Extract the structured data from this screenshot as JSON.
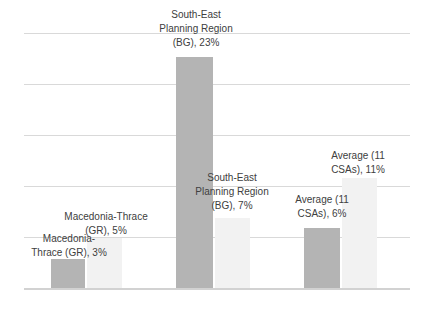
{
  "chart_data": {
    "type": "bar",
    "title": "",
    "xlabel": "",
    "ylabel": "",
    "value_unit": "%",
    "ylim": [
      0,
      25
    ],
    "gridline_interval_percent": 5,
    "grid": true,
    "legend": false,
    "px_per_percent": 10.1,
    "categories": [
      "Macedonia-Thrace (GR)",
      "South-East Planning Region (BG)",
      "Average (11 CSAs)"
    ],
    "series": [
      {
        "name": "dark-gray-series",
        "color": "#b4b4b4",
        "values": [
          3,
          23,
          6
        ]
      },
      {
        "name": "light-gray-series",
        "color": "#f2f2f2",
        "values": [
          5,
          7,
          11
        ]
      }
    ],
    "colors": {
      "gridline": "#d9d9d9",
      "axis_line": "#d2d2d2",
      "label_text": "#404040",
      "background": "#ffffff"
    }
  },
  "labels": {
    "mt_dark": {
      "line1": "Macedonia-",
      "line2": "Thrace (GR), 3%"
    },
    "mt_light": {
      "line1": "Macedonia-Thrace",
      "line2": "(GR), 5%"
    },
    "se_dark": {
      "line1": "South-East",
      "line2": "Planning Region",
      "line3": "(BG), 23%"
    },
    "se_light": {
      "line1": "South-East",
      "line2": "Planning Region",
      "line3": "(BG), 7%"
    },
    "avg_dark": {
      "line1": "Average (11",
      "line2": "CSAs), 6%"
    },
    "avg_light": {
      "line1": "Average (11",
      "line2": "CSAs), 11%"
    }
  }
}
